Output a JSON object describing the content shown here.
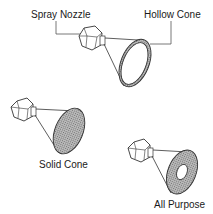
{
  "diagram": {
    "labels": {
      "spray_nozzle": "Spray Nozzle",
      "hollow_cone": "Hollow Cone",
      "solid_cone": "Solid Cone",
      "all_purpose": "All Purpose"
    },
    "nozzles": [
      {
        "type": "Hollow Cone",
        "pattern": "ring"
      },
      {
        "type": "Solid Cone",
        "pattern": "filled"
      },
      {
        "type": "All Purpose",
        "pattern": "filled-with-center-hole"
      }
    ],
    "colors": {
      "stroke": "#333333",
      "fill": "#9a9a9a",
      "background": "#ffffff"
    }
  }
}
